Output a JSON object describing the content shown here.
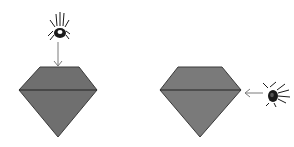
{
  "figure": {
    "background": "#ffffff",
    "panels": [
      {
        "id": "left",
        "shape": "diamond-gem",
        "fill": "#6f6f6f",
        "stroke": "#2e2e2e",
        "insect": {
          "type": "bug",
          "position": "top"
        },
        "arrow": {
          "direction": "down",
          "color": "#777777"
        }
      },
      {
        "id": "right",
        "shape": "diamond-gem",
        "fill": "#7a7a7a",
        "stroke": "#2e2e2e",
        "insect": {
          "type": "bug",
          "position": "right"
        },
        "arrow": {
          "direction": "left",
          "color": "#777777"
        }
      }
    ]
  }
}
